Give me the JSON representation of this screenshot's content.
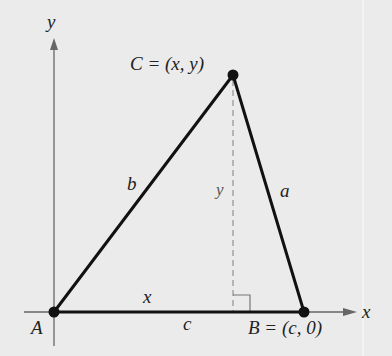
{
  "diagram": {
    "type": "triangle-on-coordinate-axes",
    "axes": {
      "x_label": "x",
      "y_label": "y"
    },
    "vertices": {
      "A": {
        "label": "A"
      },
      "B": {
        "label": "B = (c, 0)",
        "name": "B",
        "coords": "(c, 0)"
      },
      "C": {
        "label": "C = (x, y)",
        "name": "C",
        "coords": "(x, y)"
      }
    },
    "sides": {
      "a": "a",
      "b": "b",
      "c": "c"
    },
    "segments": {
      "x": "x",
      "height": "y"
    },
    "colors": {
      "background": "#ebebeb",
      "triangle": "#111111",
      "axes": "#666666",
      "height_line": "#999999"
    }
  }
}
